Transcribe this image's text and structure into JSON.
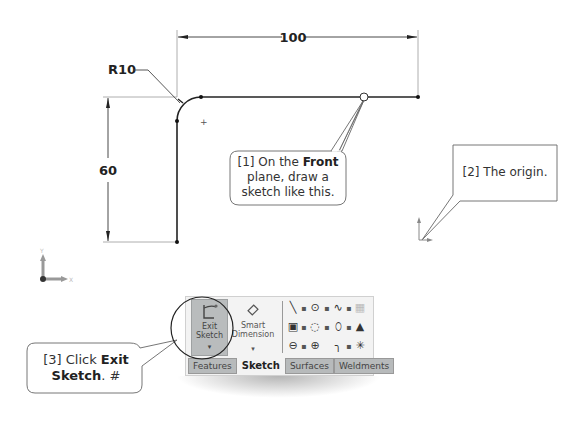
{
  "sketch": {
    "dimensions": {
      "horizontal": "100",
      "vertical": "60",
      "radius": "R10"
    }
  },
  "callouts": {
    "step1": {
      "prefix": "[1] On the ",
      "bold": "Front",
      "suffix": " plane, draw a sketch like this."
    },
    "step2": {
      "text": "[2] The origin."
    },
    "step3": {
      "prefix": "[3] Click ",
      "bold": "Exit Sketch",
      "suffix": ". #"
    }
  },
  "axes": {
    "x_label": "X",
    "y_label": "Y"
  },
  "ribbon": {
    "exit_sketch": {
      "line1": "Exit",
      "line2": "Sketch"
    },
    "smart_dimension": {
      "line1": "Smart",
      "line2": "Dimension"
    },
    "tools": [
      {
        "icon": "line-icon"
      },
      {
        "icon": "circle-icon"
      },
      {
        "icon": "spline-icon"
      },
      {
        "icon": "grid-icon"
      },
      {
        "icon": "rectangle-icon"
      },
      {
        "icon": "arc-icon"
      },
      {
        "icon": "ellipse-icon"
      },
      {
        "icon": "triangle-pattern-icon"
      },
      {
        "icon": "slot-icon"
      },
      {
        "icon": "polygon-icon"
      },
      {
        "icon": "fillet-icon"
      },
      {
        "icon": "point-icon"
      }
    ],
    "tabs": [
      {
        "label": "Features",
        "active": false
      },
      {
        "label": "Sketch",
        "active": true
      },
      {
        "label": "Surfaces",
        "active": false
      },
      {
        "label": "Weldments",
        "active": false
      }
    ]
  },
  "colors": {
    "ribbon_bg": "#f3f3f3",
    "button_active": "#b9bcbd",
    "tab_inactive": "#b7babb"
  }
}
